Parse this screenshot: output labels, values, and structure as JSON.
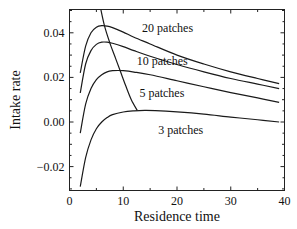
{
  "chart_data": {
    "type": "line",
    "title": "",
    "xlabel": "Residence time",
    "ylabel": "Intake rate",
    "xlim": [
      0,
      40
    ],
    "ylim": [
      -0.03,
      0.052
    ],
    "xticks": [
      0,
      10,
      20,
      30,
      40
    ],
    "xtick_labels": [
      "0",
      "10",
      "20",
      "30",
      "40"
    ],
    "yticks": [
      -0.02,
      0.0,
      0.02,
      0.04
    ],
    "ytick_labels": [
      "−0.02",
      "0.00",
      "0.02",
      "0.04"
    ],
    "grid": false,
    "legend": "inline labels",
    "series": [
      {
        "name": "20 patches",
        "label": "20 patches",
        "x": [
          2,
          3,
          4,
          5,
          6,
          7,
          8,
          10,
          12,
          15,
          20,
          25,
          30,
          35,
          39
        ],
        "y": [
          0.022,
          0.034,
          0.04,
          0.0425,
          0.0432,
          0.043,
          0.0423,
          0.0403,
          0.038,
          0.035,
          0.03,
          0.026,
          0.0225,
          0.0195,
          0.0172
        ]
      },
      {
        "name": "10 patches",
        "label": "10 patches",
        "x": [
          2,
          3,
          4,
          5,
          6,
          7,
          8,
          10,
          12,
          15,
          20,
          25,
          30,
          35,
          39
        ],
        "y": [
          0.013,
          0.026,
          0.032,
          0.0348,
          0.0358,
          0.0358,
          0.0353,
          0.0338,
          0.032,
          0.0295,
          0.0258,
          0.0225,
          0.0195,
          0.017,
          0.015
        ]
      },
      {
        "name": "5 patches",
        "label": "5 patches",
        "x": [
          2,
          3,
          4,
          5,
          6,
          7,
          8,
          9,
          10,
          12,
          15,
          20,
          25,
          30,
          35,
          39
        ],
        "y": [
          -0.005,
          0.008,
          0.015,
          0.019,
          0.0212,
          0.0225,
          0.023,
          0.0231,
          0.023,
          0.0224,
          0.0212,
          0.0185,
          0.0158,
          0.0132,
          0.0108,
          0.0088
        ]
      },
      {
        "name": "3 patches",
        "label": "3 patches",
        "x": [
          2,
          3,
          4,
          5,
          6,
          7,
          8,
          10,
          12,
          14,
          16,
          20,
          25,
          30,
          35,
          39
        ],
        "y": [
          -0.029,
          -0.016,
          -0.008,
          -0.003,
          0.0,
          0.002,
          0.0033,
          0.0045,
          0.005,
          0.0052,
          0.0051,
          0.0045,
          0.0035,
          0.0022,
          0.001,
          0.0
        ]
      },
      {
        "name": "optimum boundary",
        "label": "",
        "x": [
          5.7,
          6.5,
          7.5,
          8.5,
          9.5,
          10.5,
          11.5,
          12.6
        ],
        "y": [
          0.052,
          0.0432,
          0.0355,
          0.029,
          0.0225,
          0.016,
          0.01,
          0.0052
        ]
      }
    ],
    "annotations": [
      {
        "text": "20 patches",
        "x": 13.5,
        "y": 0.0405
      },
      {
        "text": "10 patches",
        "x": 12.5,
        "y": 0.0255
      },
      {
        "text": "5 patches",
        "x": 13.0,
        "y": 0.011
      },
      {
        "text": "3 patches",
        "x": 16.5,
        "y": -0.0055
      }
    ]
  }
}
